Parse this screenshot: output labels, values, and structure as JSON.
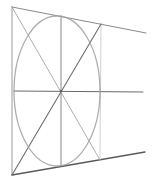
{
  "drawing": {
    "subject": "perspective circle in square",
    "colors": {
      "background": "#ffffff",
      "dark_stroke": "#5a5a5a",
      "mid_stroke": "#8a8a8a",
      "light_stroke": "#b5b5b5",
      "ellipse_stroke": "#9a9a9a"
    },
    "square": {
      "top_left": [
        12,
        7
      ],
      "bottom_left": [
        12,
        175
      ],
      "top_right": [
        101,
        24
      ],
      "bottom_right": [
        100,
        160
      ]
    },
    "vanishing_lines": {
      "top_end": [
        146,
        33
      ],
      "bottom_end": [
        145,
        152
      ],
      "horizon_end": [
        143,
        92
      ]
    },
    "center": [
      61,
      91
    ],
    "vertical_axis": {
      "top": [
        61,
        16
      ],
      "bottom": [
        61,
        166
      ]
    },
    "right_guide": {
      "top": [
        101,
        30
      ],
      "bottom": [
        101,
        160
      ]
    },
    "ellipse": {
      "cx": 57,
      "cy": 91,
      "rx": 43,
      "ry": 75
    }
  }
}
